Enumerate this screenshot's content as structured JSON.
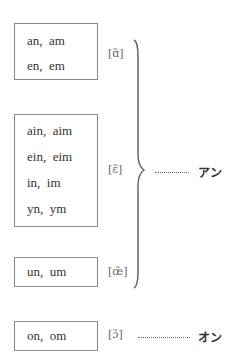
{
  "groups": [
    {
      "spellings": [
        "an,  am",
        "en,  em"
      ],
      "ipa": "[ɑ̃]"
    },
    {
      "spellings": [
        "ain,  aim",
        "ein,  eim",
        "in,  im",
        "yn,  ym"
      ],
      "ipa": "[ɛ̃]"
    },
    {
      "spellings": [
        "un,  um"
      ],
      "ipa": "[œ̃]"
    },
    {
      "spellings": [
        "on,  om"
      ],
      "ipa": "[ɔ̃]"
    }
  ],
  "readings": {
    "an_group": "アン",
    "on_group": "オン"
  },
  "colors": {
    "border": "#888888",
    "brace": "#666666",
    "text": "#333333"
  }
}
